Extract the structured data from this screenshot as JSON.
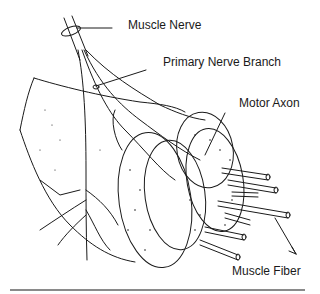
{
  "diagram": {
    "labels": {
      "muscle_nerve": "Muscle Nerve",
      "primary_nerve_branch": "Primary Nerve Branch",
      "motor_axon": "Motor Axon",
      "muscle_fiber": "Muscle Fiber"
    },
    "colors": {
      "line": "#1a1a1a",
      "background": "#ffffff",
      "rule": "#8a8a8a"
    }
  }
}
